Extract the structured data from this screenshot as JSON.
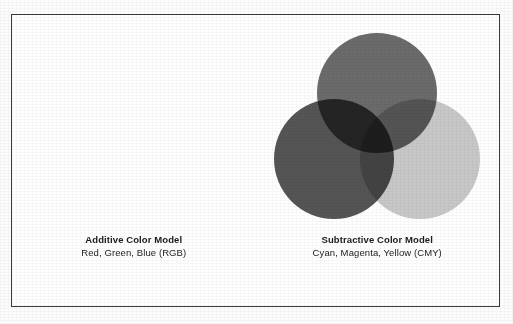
{
  "figure": {
    "background_color": "#fdfdfd",
    "frame_color": "#3a3a3c",
    "frame_fill": "#ffffff"
  },
  "panels": [
    {
      "id": "additive",
      "diagram_name": "additive-venn",
      "blend_mode": "screen",
      "base_color": "#000000",
      "caption_title": "Additive Color Model",
      "caption_sub": "Red, Green, Blue (RGB)",
      "circles": [
        {
          "name": "green-circle",
          "label": "Green",
          "cx": 109,
          "cy": 68,
          "r": 60,
          "fill": "#555555"
        },
        {
          "name": "red-circle",
          "label": "Red",
          "cx": 66,
          "cy": 134,
          "r": 60,
          "fill": "#4a4a4a"
        },
        {
          "name": "blue-circle",
          "label": "Blue",
          "cx": 152,
          "cy": 134,
          "r": 60,
          "fill": "#2a2a2a"
        }
      ],
      "overlap_notes": {
        "red_green": "#c8c8c8",
        "green_blue": "#3e3e3e",
        "red_blue": "#808080",
        "center": "#ffffff"
      }
    },
    {
      "id": "subtractive",
      "diagram_name": "subtractive-venn",
      "blend_mode": "multiply",
      "base_color": "#ffffff",
      "caption_title": "Subtractive Color Model",
      "caption_sub": "Cyan, Magenta, Yellow (CMY)",
      "circles": [
        {
          "name": "magenta-circle",
          "label": "Magenta",
          "cx": 109,
          "cy": 68,
          "r": 60,
          "fill": "#6b6b6b"
        },
        {
          "name": "cyan-circle",
          "label": "Cyan",
          "cx": 66,
          "cy": 134,
          "r": 60,
          "fill": "#555555"
        },
        {
          "name": "yellow-circle",
          "label": "Yellow",
          "cx": 152,
          "cy": 134,
          "r": 60,
          "fill": "#c8c8c8"
        }
      ],
      "overlap_notes": {
        "cyan_magenta": "#2e2e2e",
        "magenta_yellow": "#565656",
        "cyan_yellow": "#484848",
        "center": "#0d0d0d"
      }
    }
  ]
}
